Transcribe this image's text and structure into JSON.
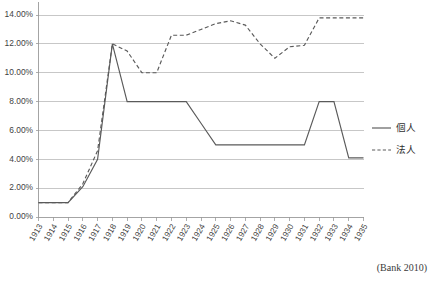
{
  "figure": {
    "source_note": "(Bank 2010)"
  },
  "legend": {
    "position": "right",
    "items": [
      {
        "label": "個人",
        "style": "solid",
        "name": "kojin"
      },
      {
        "label": "法人",
        "style": "dashed",
        "name": "hojin"
      }
    ]
  },
  "chart_data": {
    "type": "line",
    "title": "",
    "subtitle": "",
    "xlabel": "",
    "ylabel": "",
    "grid": true,
    "legend_position": "right",
    "ylim": [
      0,
      14
    ],
    "yticks": [
      0,
      2,
      4,
      6,
      8,
      10,
      12,
      14
    ],
    "ytick_labels": [
      "0.00%",
      "2.00%",
      "4.00%",
      "6.00%",
      "8.00%",
      "10.00%",
      "12.00%",
      "14.00%"
    ],
    "x": [
      1913,
      1914,
      1915,
      1916,
      1917,
      1918,
      1919,
      1920,
      1921,
      1922,
      1923,
      1924,
      1925,
      1926,
      1927,
      1928,
      1929,
      1930,
      1931,
      1932,
      1933,
      1934,
      1935
    ],
    "xtick_labels": [
      "1913",
      "1914",
      "1915",
      "1916",
      "1917",
      "1918",
      "1919",
      "1920",
      "1921",
      "1922",
      "1923",
      "1924",
      "1925",
      "1926",
      "1927",
      "1928",
      "1929",
      "1930",
      "1931",
      "1932",
      "1933",
      "1934",
      "1935"
    ],
    "series": [
      {
        "name": "個人",
        "style": "solid",
        "values": [
          1.0,
          1.0,
          1.0,
          2.1,
          4.0,
          12.0,
          8.0,
          8.0,
          8.0,
          8.0,
          8.0,
          6.5,
          5.0,
          5.0,
          5.0,
          5.0,
          5.0,
          5.0,
          5.0,
          8.0,
          8.0,
          4.1,
          4.1
        ]
      },
      {
        "name": "法人",
        "style": "dashed",
        "values": [
          1.0,
          1.0,
          1.0,
          2.3,
          4.6,
          12.0,
          11.5,
          10.0,
          10.0,
          12.6,
          12.6,
          13.0,
          13.4,
          13.6,
          13.3,
          12.0,
          11.0,
          11.8,
          11.9,
          13.8,
          13.8,
          13.8,
          13.8
        ]
      }
    ]
  }
}
